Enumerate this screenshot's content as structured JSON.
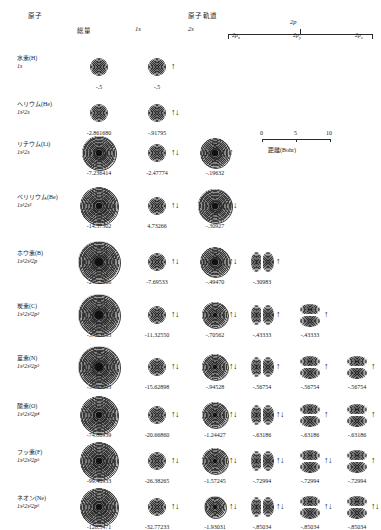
{
  "header": {
    "atom_label": "原子",
    "total_label": "総量",
    "orbital_1s": "1s",
    "ao_label": "原子軌道",
    "orbital_2s": "2s",
    "orbital_2p": "2p",
    "p_sub_labels": [
      "2p",
      "2p",
      "2p"
    ],
    "p_sub_indices": [
      "x",
      "y",
      "z"
    ]
  },
  "scale": {
    "ticks": [
      "0",
      "5",
      "10"
    ],
    "caption": "距離(Bohr)"
  },
  "elements": [
    {
      "name": "水素(H)",
      "config": "1s",
      "config_sup": "",
      "cells": [
        {
          "col": "total",
          "energy": "-.5",
          "type": "s",
          "shells": 1,
          "spin": ""
        },
        {
          "col": "1s",
          "energy": "-.5",
          "type": "s",
          "shells": 1,
          "spin": "↑"
        }
      ]
    },
    {
      "name": "ヘリウム(He)",
      "config": "1s²2s",
      "cells": [
        {
          "col": "total",
          "energy": "-2.861680",
          "type": "s",
          "shells": 1,
          "spin": ""
        },
        {
          "col": "1s",
          "energy": "-.91795",
          "type": "s",
          "shells": 1,
          "spin": "↑↓"
        }
      ]
    },
    {
      "name": "リチウム(Li)",
      "config": "1s²2s",
      "cells": [
        {
          "col": "total",
          "energy": "-7.236414",
          "type": "s",
          "shells": 5,
          "spin": ""
        },
        {
          "col": "1s",
          "energy": "-2.47774",
          "type": "s",
          "shells": 1,
          "spin": "↑↓"
        },
        {
          "col": "2s",
          "energy": "-.19632",
          "type": "s",
          "shells": 4,
          "spin": "↑"
        }
      ]
    },
    {
      "name": "ベリリウム(Be)",
      "config": "1s²2s²",
      "cells": [
        {
          "col": "total",
          "energy": "-14.57302",
          "type": "s",
          "shells": 6,
          "spin": ""
        },
        {
          "col": "1s",
          "energy": "4.73266",
          "type": "s",
          "shells": 1,
          "spin": "↑↓"
        },
        {
          "col": "2s",
          "energy": "-.30927",
          "type": "s",
          "shells": 5,
          "spin": "↑↓"
        }
      ]
    },
    {
      "name": "ホウ素(B)",
      "config": "1s²2s²2p",
      "cells": [
        {
          "col": "total",
          "energy": "-24.52906",
          "type": "s",
          "shells": 7,
          "spin": ""
        },
        {
          "col": "1s",
          "energy": "-7.69533",
          "type": "s",
          "shells": 1,
          "spin": "↑↓"
        },
        {
          "col": "2s",
          "energy": "-.49470",
          "type": "s",
          "shells": 4,
          "spin": "↑↓"
        },
        {
          "col": "2px",
          "energy": "-.30983",
          "type": "p",
          "axis": "x",
          "spin": "↑"
        }
      ]
    },
    {
      "name": "炭素(C)",
      "config": "1s²2s²2p²",
      "cells": [
        {
          "col": "total",
          "energy": "-37.63133",
          "type": "s",
          "shells": 7,
          "spin": ""
        },
        {
          "col": "1s",
          "energy": "-11.32550",
          "type": "s",
          "shells": 1,
          "spin": "↑↓"
        },
        {
          "col": "2s",
          "energy": "-.70562",
          "type": "s",
          "shells": 3,
          "spin": "↑↓"
        },
        {
          "col": "2px",
          "energy": "-.43333",
          "type": "p",
          "axis": "x",
          "spin": "↑"
        },
        {
          "col": "2py",
          "energy": "-.43333",
          "type": "p",
          "axis": "y",
          "spin": "↑"
        }
      ]
    },
    {
      "name": "窒素(N)",
      "config": "1s²2s²2p³",
      "cells": [
        {
          "col": "total",
          "energy": "-54.40093",
          "type": "s",
          "shells": 7,
          "spin": ""
        },
        {
          "col": "1s",
          "energy": "-15.62898",
          "type": "s",
          "shells": 1,
          "spin": "↑↓"
        },
        {
          "col": "2s",
          "energy": "-.94528",
          "type": "s",
          "shells": 3,
          "spin": "↑↓"
        },
        {
          "col": "2px",
          "energy": "-.56754",
          "type": "p",
          "axis": "x",
          "spin": "↑"
        },
        {
          "col": "2py",
          "energy": "-.56754",
          "type": "p",
          "axis": "y",
          "spin": "↑"
        },
        {
          "col": "2pz",
          "energy": "-.56754",
          "type": "p",
          "axis": "y",
          "spin": "↑"
        }
      ]
    },
    {
      "name": "酸素(O)",
      "config": "1s²2s²2p⁴",
      "cells": [
        {
          "col": "total",
          "energy": "-74.80939",
          "type": "s",
          "shells": 6,
          "spin": ""
        },
        {
          "col": "1s",
          "energy": "-20.66860",
          "type": "s",
          "shells": 1,
          "spin": "↑↓"
        },
        {
          "col": "2s",
          "energy": "-1.24427",
          "type": "s",
          "shells": 3,
          "spin": "↑↓"
        },
        {
          "col": "2px",
          "energy": "-.63186",
          "type": "p",
          "axis": "x",
          "spin": "↑↓"
        },
        {
          "col": "2py",
          "energy": "-.63186",
          "type": "p",
          "axis": "y",
          "spin": "↑"
        },
        {
          "col": "2pz",
          "energy": "-.63186",
          "type": "p",
          "axis": "y",
          "spin": "↑"
        }
      ]
    },
    {
      "name": "フッ素(F)",
      "config": "1s²2s²2p⁵",
      "cells": [
        {
          "col": "total",
          "energy": "-99.40933",
          "type": "s",
          "shells": 6,
          "spin": ""
        },
        {
          "col": "1s",
          "energy": "-26.38265",
          "type": "s",
          "shells": 1,
          "spin": "↑↓"
        },
        {
          "col": "2s",
          "energy": "-1.57245",
          "type": "s",
          "shells": 3,
          "spin": "↑↓"
        },
        {
          "col": "2px",
          "energy": "-.72994",
          "type": "p",
          "axis": "x",
          "spin": "↑↓"
        },
        {
          "col": "2py",
          "energy": "-.72994",
          "type": "p",
          "axis": "y",
          "spin": "↑↓"
        },
        {
          "col": "2pz",
          "energy": "-.72994",
          "type": "p",
          "axis": "y",
          "spin": "↑"
        }
      ]
    },
    {
      "name": "ネオン(Ne)",
      "config": "1s²2s²2p⁶",
      "cells": [
        {
          "col": "total",
          "energy": "-128.5471",
          "type": "s",
          "shells": 6,
          "spin": ""
        },
        {
          "col": "1s",
          "energy": "-32.77233",
          "type": "s",
          "shells": 1,
          "spin": "↑↓"
        },
        {
          "col": "2s",
          "energy": "-1.93031",
          "type": "s",
          "shells": 2,
          "spin": "↑↓"
        },
        {
          "col": "2px",
          "energy": "-.85034",
          "type": "p",
          "axis": "x",
          "spin": "↑↓"
        },
        {
          "col": "2py",
          "energy": "-.85034",
          "type": "p",
          "axis": "y",
          "spin": "↑↓"
        },
        {
          "col": "2pz",
          "energy": "-.85034",
          "type": "p",
          "axis": "y",
          "spin": "↑↓"
        }
      ]
    }
  ]
}
